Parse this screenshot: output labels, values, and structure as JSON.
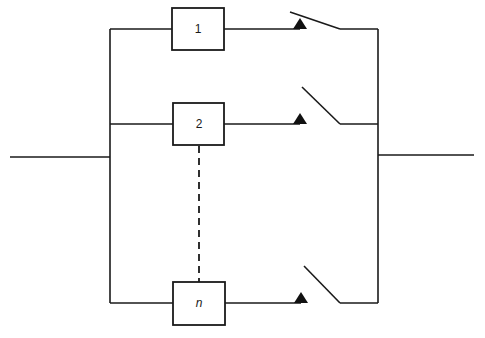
{
  "diagram": {
    "type": "parallel redundancy block diagram with switches",
    "colors": {
      "line": "#1a1a1a",
      "background": "#ffffff",
      "contact": "#111111"
    },
    "input_line": {
      "x1": 10,
      "x2": 110,
      "y": 157
    },
    "output_line": {
      "x1": 378,
      "x2": 474,
      "y": 155
    },
    "left_bus": {
      "x": 110,
      "y1": 29,
      "y2": 303
    },
    "right_bus": {
      "x": 378,
      "y1": 29,
      "y2": 303
    },
    "branches": [
      {
        "label": "1",
        "italic": false,
        "y": 29,
        "box": {
          "x": 172,
          "y": 8,
          "w": 52,
          "h": 42
        },
        "switch": {
          "contact_x": 300,
          "lever_start": [
            290,
            12
          ],
          "lever_end": [
            340,
            29
          ]
        }
      },
      {
        "label": "2",
        "italic": false,
        "y": 124,
        "box": {
          "x": 173,
          "y": 103,
          "w": 51,
          "h": 42
        },
        "switch": {
          "contact_x": 300,
          "lever_start": [
            302,
            87
          ],
          "lever_end": [
            340,
            124
          ]
        }
      },
      {
        "label": "n",
        "italic": true,
        "y": 303,
        "box": {
          "x": 173,
          "y": 282,
          "w": 52,
          "h": 43
        },
        "switch": {
          "contact_x": 301,
          "lever_start": [
            304,
            266
          ],
          "lever_end": [
            340,
            303
          ]
        }
      }
    ],
    "dashed_link": {
      "x": 199,
      "y1": 145,
      "y2": 282,
      "meaning": "branches 3 to n-1 omitted"
    }
  }
}
